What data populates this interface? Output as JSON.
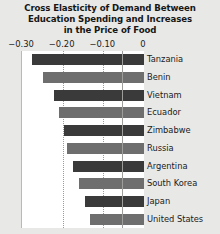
{
  "chart_data": {
    "type": "bar",
    "orientation": "horizontal",
    "title": "Cross Elasticity of Demand Between Education Spending and Increases in the Price of Food",
    "title_lines": [
      "Cross Elasticity of Demand Between",
      "Education Spending and Increases",
      "in the Price of Food"
    ],
    "xlabel": "",
    "ylabel": "",
    "categories": [
      "Tanzania",
      "Benin",
      "Vietnam",
      "Ecuador",
      "Zimbabwe",
      "Russia",
      "Argentina",
      "South Korea",
      "Japan",
      "United States"
    ],
    "values": [
      -0.275,
      -0.248,
      -0.221,
      -0.209,
      -0.196,
      -0.189,
      -0.174,
      -0.16,
      -0.145,
      -0.133
    ],
    "xlim": [
      -0.3,
      0
    ],
    "xticks": [
      -0.3,
      -0.2,
      -0.1,
      0
    ],
    "xticklabels": [
      "−0.30",
      "−0.20",
      "−0.10",
      "0"
    ],
    "grid": "vertical-dotted",
    "gridlines_at": [
      -0.2,
      -0.1
    ],
    "legend": "none",
    "bar_colors": [
      "#3a3a3a",
      "#6e6e6e"
    ],
    "plot_background": "#ffffff",
    "page_background": "#e8e8e6"
  }
}
